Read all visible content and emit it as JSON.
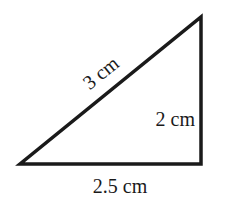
{
  "figure": {
    "shape": "right-triangle",
    "stroke_color": "#1a1a1a",
    "background_color": "#ffffff",
    "vertices": {
      "top": [
        201,
        17
      ],
      "bottom_left": [
        20,
        164
      ],
      "bottom_right": [
        201,
        164
      ]
    },
    "labels": {
      "hypotenuse": "3 cm",
      "vertical_side": "2 cm",
      "base": "2.5 cm"
    }
  }
}
